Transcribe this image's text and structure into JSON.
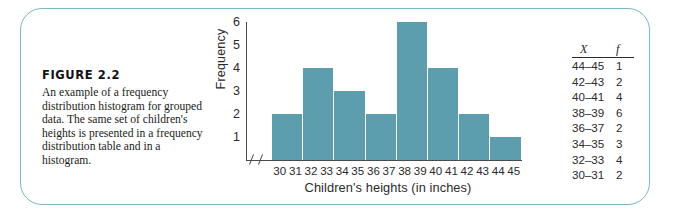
{
  "figure": {
    "title": "FIGURE 2.2",
    "caption": "An example of a frequency distribution histogram for grouped data. The same set of children's heights is presented in a frequency distribution table and in a histogram.",
    "frame_color": "#79b8c4",
    "bar_color": "#5d9eae"
  },
  "table": {
    "header_x": "X",
    "header_f": "f",
    "rows": [
      {
        "x": "44–45",
        "f": "1"
      },
      {
        "x": "42–43",
        "f": "2"
      },
      {
        "x": "40–41",
        "f": "4"
      },
      {
        "x": "38–39",
        "f": "6"
      },
      {
        "x": "36–37",
        "f": "2"
      },
      {
        "x": "34–35",
        "f": "3"
      },
      {
        "x": "32–33",
        "f": "4"
      },
      {
        "x": "30–31",
        "f": "2"
      }
    ]
  },
  "chart_data": {
    "type": "bar",
    "title": "",
    "xlabel": "Children's heights (in inches)",
    "ylabel": "Frequency",
    "categories": [
      "30–31",
      "32–33",
      "34–35",
      "36–37",
      "38–39",
      "40–41",
      "42–43",
      "44–45"
    ],
    "values": [
      2,
      4,
      3,
      2,
      6,
      4,
      2,
      1
    ],
    "ylim": [
      0,
      6
    ],
    "yticks": [
      6,
      5,
      4,
      3,
      2,
      1
    ],
    "ytick_labels": [
      "6",
      "5",
      "4",
      "3",
      "2",
      "1"
    ],
    "xticks": [
      30,
      31,
      32,
      33,
      34,
      35,
      36,
      37,
      38,
      39,
      40,
      41,
      42,
      43,
      44,
      45
    ],
    "xtick_labels": [
      "30",
      "31",
      "32",
      "33",
      "34",
      "35",
      "36",
      "37",
      "38",
      "39",
      "40",
      "41",
      "42",
      "43",
      "44",
      "45"
    ],
    "grid": false,
    "legend": false,
    "axis_break": true,
    "bar_color": "#5d9eae"
  }
}
